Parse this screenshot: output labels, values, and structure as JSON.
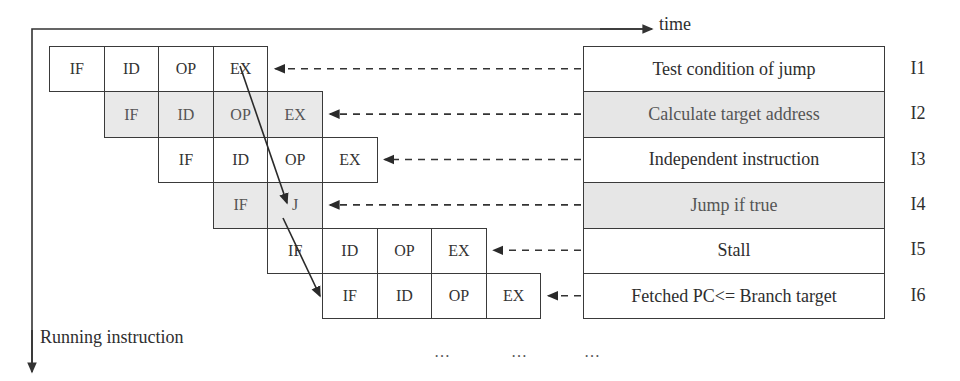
{
  "axes": {
    "time_label": "time",
    "running_label": "Running instruction"
  },
  "rows": [
    {
      "id": "I1",
      "label": "I1",
      "description": "Test condition of jump",
      "shaded": false,
      "start_col": 0,
      "stages": [
        "IF",
        "ID",
        "OP",
        "EX"
      ]
    },
    {
      "id": "I2",
      "label": "I2",
      "description": "Calculate target address",
      "shaded": true,
      "start_col": 1,
      "stages": [
        "IF",
        "ID",
        "OP",
        "EX"
      ]
    },
    {
      "id": "I3",
      "label": "I3",
      "description": "Independent instruction",
      "shaded": false,
      "start_col": 2,
      "stages": [
        "IF",
        "ID",
        "OP",
        "EX"
      ]
    },
    {
      "id": "I4",
      "label": "I4",
      "description": "Jump if true",
      "shaded": true,
      "start_col": 3,
      "stages": [
        "IF",
        "J"
      ]
    },
    {
      "id": "I5",
      "label": "I5",
      "description": "Stall",
      "shaded": false,
      "start_col": 4,
      "stages": [
        "IF",
        "ID",
        "OP",
        "EX"
      ]
    },
    {
      "id": "I6",
      "label": "I6",
      "description": "Fetched PC<= Branch target",
      "shaded": false,
      "start_col": 5,
      "stages": [
        "IF",
        "ID",
        "OP",
        "EX"
      ]
    }
  ],
  "dependency_arrows": [
    {
      "from": "I1.EX",
      "to": "I4.J"
    },
    {
      "from": "I4.J",
      "to": "I6.IF"
    }
  ],
  "continuation": [
    "…",
    "…",
    "…"
  ],
  "colors": {
    "line": "#3a3a3a",
    "shade": "#e8e8e8",
    "text": "#2e2e2e"
  }
}
